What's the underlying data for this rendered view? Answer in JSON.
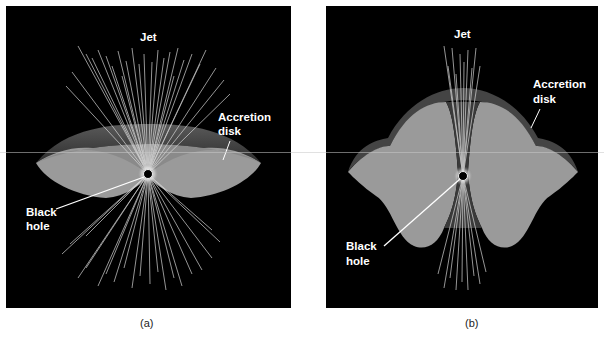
{
  "figure": {
    "panels": [
      {
        "id": "a",
        "caption": "(a)",
        "labels": {
          "jet": "Jet",
          "disk_line1": "Accretion",
          "disk_line2": "disk",
          "bh_line1": "Black",
          "bh_line2": "hole"
        },
        "description": "Thin, flattened accretion disk with broad, wide-angle jets"
      },
      {
        "id": "b",
        "caption": "(b)",
        "labels": {
          "jet": "Jet",
          "disk_line1": "Accretion",
          "disk_line2": "disk",
          "bh_line1": "Black",
          "bh_line2": "hole"
        },
        "description": "Thick, puffed-up accretion disk with narrow, collimated jets"
      }
    ],
    "colors": {
      "background": "#000000",
      "disk_face": "#9a9a9a",
      "disk_rim": "#4a4a4a",
      "jet_lines": "#dcdcdc",
      "label_text": "#ffffff",
      "page": "#ffffff"
    }
  }
}
